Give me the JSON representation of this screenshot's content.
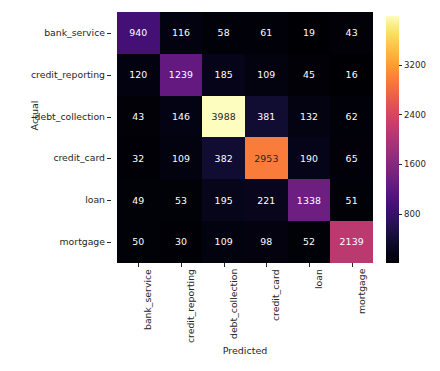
{
  "chart_data": {
    "type": "heatmap",
    "title": "",
    "xlabel": "Predicted",
    "ylabel": "Actual",
    "categories_x": [
      "bank_service",
      "credit_reporting",
      "debt_collection",
      "credit_card",
      "loan",
      "mortgage"
    ],
    "categories_y": [
      "bank_service",
      "credit_reporting",
      "debt_collection",
      "credit_card",
      "loan",
      "mortgage"
    ],
    "rows": [
      {
        "label": "bank_service",
        "values": [
          940,
          116,
          58,
          61,
          19,
          43
        ]
      },
      {
        "label": "credit_reporting",
        "values": [
          120,
          1239,
          185,
          109,
          45,
          16
        ]
      },
      {
        "label": "debt_collection",
        "values": [
          43,
          146,
          3988,
          381,
          132,
          62
        ]
      },
      {
        "label": "credit_card",
        "values": [
          32,
          109,
          382,
          2953,
          190,
          65
        ]
      },
      {
        "label": "loan",
        "values": [
          49,
          53,
          195,
          221,
          1338,
          51
        ]
      },
      {
        "label": "mortgage",
        "values": [
          50,
          30,
          109,
          98,
          52,
          2139
        ]
      }
    ],
    "colormap": "magma",
    "colorbar": {
      "ticks": [
        800,
        1600,
        2400,
        3200
      ],
      "tick_labels": [
        "800",
        "1600",
        "2400",
        "3200"
      ],
      "vmin": 16,
      "vmax": 3988,
      "position": "right"
    },
    "grid": false,
    "legend": false,
    "annotations": "every cell labeled with its integer count"
  },
  "colors": {
    "background": "#ffffff",
    "text": "#262626",
    "cell_text_light": "#ffffff",
    "cell_text_dark": "#262626",
    "cmap_low": "#000004",
    "cmap_high": "#fcfdbf"
  }
}
